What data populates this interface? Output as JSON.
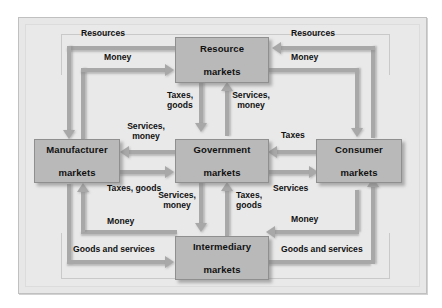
{
  "diagram": {
    "nodes": [
      {
        "id": "resource",
        "label_line1": "Resource",
        "label_line2": "markets"
      },
      {
        "id": "manufacturer",
        "label_line1": "Manufacturer",
        "label_line2": "markets"
      },
      {
        "id": "government",
        "label_line1": "Government",
        "label_line2": "markets"
      },
      {
        "id": "consumer",
        "label_line1": "Consumer",
        "label_line2": "markets"
      },
      {
        "id": "intermediary",
        "label_line1": "Intermediary",
        "label_line2": "markets"
      }
    ],
    "flows": [
      {
        "id": "res-top-left",
        "label": "Resources",
        "from": "resource",
        "to": "manufacturer",
        "direction": "down-left"
      },
      {
        "id": "money-top-left",
        "label": "Money",
        "from": "manufacturer",
        "to": "resource",
        "direction": "right"
      },
      {
        "id": "res-top-right",
        "label": "Resources",
        "from": "consumer",
        "to": "resource",
        "direction": "left"
      },
      {
        "id": "money-top-right",
        "label": "Money",
        "from": "resource",
        "to": "consumer",
        "direction": "down-right"
      },
      {
        "id": "taxes-goods-upper",
        "label_line1": "Taxes,",
        "label_line2": "goods",
        "from": "resource",
        "to": "government",
        "direction": "down"
      },
      {
        "id": "services-money-upper",
        "label_line1": "Services,",
        "label_line2": "money",
        "from": "government",
        "to": "resource",
        "direction": "up"
      },
      {
        "id": "services-money-left",
        "label_line1": "Services,",
        "label_line2": "money",
        "from": "government",
        "to": "manufacturer",
        "direction": "left"
      },
      {
        "id": "taxes-goods-left",
        "label": "Taxes, goods",
        "from": "manufacturer",
        "to": "government",
        "direction": "right"
      },
      {
        "id": "taxes-right",
        "label": "Taxes",
        "from": "consumer",
        "to": "government",
        "direction": "left"
      },
      {
        "id": "services-right",
        "label": "Services",
        "from": "government",
        "to": "consumer",
        "direction": "right"
      },
      {
        "id": "services-money-lower",
        "label_line1": "Services,",
        "label_line2": "money",
        "from": "government",
        "to": "intermediary",
        "direction": "down"
      },
      {
        "id": "taxes-goods-lower",
        "label_line1": "Taxes,",
        "label_line2": "goods",
        "from": "intermediary",
        "to": "government",
        "direction": "up"
      },
      {
        "id": "money-bottom-left",
        "label": "Money",
        "from": "intermediary",
        "to": "manufacturer",
        "direction": "up-left"
      },
      {
        "id": "goods-bottom-left",
        "label": "Goods and services",
        "from": "manufacturer",
        "to": "intermediary",
        "direction": "right"
      },
      {
        "id": "money-bottom-right",
        "label": "Money",
        "from": "consumer",
        "to": "intermediary",
        "direction": "left"
      },
      {
        "id": "goods-bottom-right",
        "label": "Goods and services",
        "from": "intermediary",
        "to": "consumer",
        "direction": "up-right"
      }
    ],
    "colors": {
      "panel_background": "#e9e9e9",
      "node_fill": "#b9b9b9",
      "arrow": "#a8a8a8",
      "text": "#111111"
    }
  }
}
